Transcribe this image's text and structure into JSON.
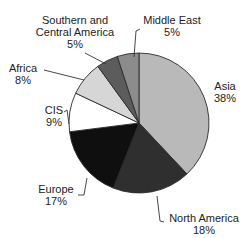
{
  "chart_data": {
    "type": "pie",
    "title": "",
    "start_angle_deg": 0,
    "direction": "clockwise",
    "slices": [
      {
        "label": "Asia",
        "value": 38,
        "value_label": "38%",
        "color": "#b9b9b9"
      },
      {
        "label": "North America",
        "value": 18,
        "value_label": "18%",
        "color": "#2f2f2f"
      },
      {
        "label": "Europe",
        "value": 17,
        "value_label": "17%",
        "color": "#0f0f0f"
      },
      {
        "label": "CIS",
        "value": 9,
        "value_label": "9%",
        "color": "#ffffff"
      },
      {
        "label": "Africa",
        "value": 8,
        "value_label": "8%",
        "color": "#d6d6d6"
      },
      {
        "label": "Southern and Central America",
        "value": 5,
        "value_label": "5%",
        "color": "#5c5c5c"
      },
      {
        "label": "Middle East",
        "value": 5,
        "value_label": "5%",
        "color": "#8c8c8c"
      }
    ],
    "legend": "none (direct labels with leader lines)"
  },
  "labels": {
    "asia": {
      "name": "Asia",
      "pct": "38%"
    },
    "north_america": {
      "name": "North America",
      "pct": "18%"
    },
    "europe": {
      "name": "Europe",
      "pct": "17%"
    },
    "cis": {
      "name": "CIS",
      "pct": "9%"
    },
    "africa": {
      "name": "Africa",
      "pct": "8%"
    },
    "sca": {
      "name_line1": "Southern and",
      "name_line2": "Central America",
      "pct": "5%"
    },
    "middle_east": {
      "name": "Middle East",
      "pct": "5%"
    }
  }
}
